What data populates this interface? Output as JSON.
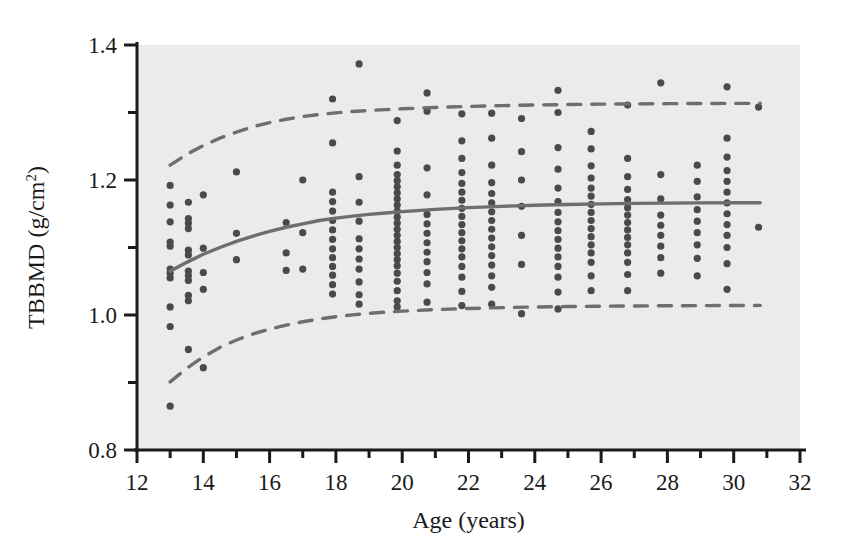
{
  "chart_data": {
    "type": "scatter",
    "title": "",
    "xlabel": "Age (years)",
    "ylabel": "TBBMD (g/cm2)",
    "ylabel_base": "TBBMD (g/cm",
    "ylabel_sup": "2",
    "ylabel_close": ")",
    "xlim": [
      12,
      32
    ],
    "ylim": [
      0.8,
      1.4
    ],
    "xticks_major": [
      12,
      14,
      16,
      18,
      20,
      22,
      24,
      26,
      28,
      30,
      32
    ],
    "xticks_minor": [
      13,
      15,
      17,
      19,
      21,
      23,
      25,
      27,
      29,
      31
    ],
    "yticks_major": [
      0.8,
      1.0,
      1.2,
      1.4
    ],
    "yticks_minor": [
      0.9,
      1.1,
      1.3
    ],
    "xtick_labels": [
      "12",
      "14",
      "16",
      "18",
      "20",
      "22",
      "24",
      "26",
      "28",
      "30",
      "32"
    ],
    "ytick_labels": [
      "0.8",
      "1.0",
      "1.2",
      "1.4"
    ],
    "grid": false,
    "legend": "none",
    "plot_bg": "#ebebeb",
    "point_color": "#4a4a4a",
    "line_color": "#6e6e6e",
    "axis_color": "#1a1a1a",
    "point_radius": 3.6,
    "series": [
      {
        "name": "Mean TBBMD curve",
        "style": "solid",
        "x": [
          13.0,
          13.5,
          14.0,
          14.5,
          15.0,
          15.5,
          16.0,
          16.5,
          17.0,
          17.5,
          18.0,
          18.5,
          19.0,
          19.5,
          20.0,
          21.0,
          22.0,
          23.0,
          24.0,
          25.0,
          26.0,
          27.0,
          28.0,
          29.0,
          30.0,
          30.8
        ],
        "values": [
          1.065,
          1.078,
          1.09,
          1.1,
          1.109,
          1.117,
          1.124,
          1.13,
          1.135,
          1.14,
          1.1435,
          1.1465,
          1.149,
          1.1512,
          1.1532,
          1.1565,
          1.159,
          1.161,
          1.1625,
          1.1637,
          1.1646,
          1.1653,
          1.1658,
          1.1661,
          1.1663,
          1.1664
        ]
      },
      {
        "name": "Upper reference limit",
        "style": "dashed",
        "x": [
          13.0,
          13.5,
          14.0,
          14.5,
          15.0,
          15.5,
          16.0,
          16.5,
          17.0,
          17.5,
          18.0,
          18.5,
          19.0,
          19.5,
          20.0,
          21.0,
          22.0,
          23.0,
          24.0,
          25.0,
          26.0,
          27.0,
          28.0,
          29.0,
          30.0,
          30.8
        ],
        "values": [
          1.222,
          1.238,
          1.251,
          1.262,
          1.271,
          1.279,
          1.285,
          1.29,
          1.294,
          1.297,
          1.2995,
          1.3015,
          1.303,
          1.3043,
          1.3055,
          1.3075,
          1.309,
          1.3102,
          1.3111,
          1.3118,
          1.3124,
          1.3128,
          1.3131,
          1.3133,
          1.3135,
          1.3136
        ]
      },
      {
        "name": "Lower reference limit",
        "style": "dashed",
        "x": [
          13.0,
          13.5,
          14.0,
          14.5,
          15.0,
          15.5,
          16.0,
          16.5,
          17.0,
          17.5,
          18.0,
          18.5,
          19.0,
          19.5,
          20.0,
          21.0,
          22.0,
          23.0,
          24.0,
          25.0,
          26.0,
          27.0,
          28.0,
          29.0,
          30.0,
          30.8
        ],
        "values": [
          0.901,
          0.921,
          0.938,
          0.952,
          0.963,
          0.972,
          0.979,
          0.985,
          0.99,
          0.994,
          0.9975,
          1.0002,
          1.0024,
          1.0042,
          1.0057,
          1.008,
          1.0097,
          1.0109,
          1.0118,
          1.0125,
          1.013,
          1.0134,
          1.0137,
          1.0139,
          1.0141,
          1.0142
        ]
      }
    ],
    "points": [
      {
        "x": 13.0,
        "y": 0.865
      },
      {
        "x": 13.0,
        "y": 0.983
      },
      {
        "x": 13.0,
        "y": 1.012
      },
      {
        "x": 13.0,
        "y": 1.055
      },
      {
        "x": 13.0,
        "y": 1.062
      },
      {
        "x": 13.0,
        "y": 1.068
      },
      {
        "x": 13.0,
        "y": 1.102
      },
      {
        "x": 13.0,
        "y": 1.108
      },
      {
        "x": 13.0,
        "y": 1.138
      },
      {
        "x": 13.0,
        "y": 1.163
      },
      {
        "x": 13.0,
        "y": 1.192
      },
      {
        "x": 13.55,
        "y": 0.949
      },
      {
        "x": 13.55,
        "y": 1.021
      },
      {
        "x": 13.55,
        "y": 1.029
      },
      {
        "x": 13.55,
        "y": 1.051
      },
      {
        "x": 13.55,
        "y": 1.058
      },
      {
        "x": 13.55,
        "y": 1.065
      },
      {
        "x": 13.55,
        "y": 1.089
      },
      {
        "x": 13.55,
        "y": 1.096
      },
      {
        "x": 13.55,
        "y": 1.128
      },
      {
        "x": 13.55,
        "y": 1.136
      },
      {
        "x": 13.55,
        "y": 1.143
      },
      {
        "x": 13.55,
        "y": 1.167
      },
      {
        "x": 14.0,
        "y": 0.922
      },
      {
        "x": 14.0,
        "y": 1.038
      },
      {
        "x": 14.0,
        "y": 1.063
      },
      {
        "x": 14.0,
        "y": 1.099
      },
      {
        "x": 14.0,
        "y": 1.178
      },
      {
        "x": 15.0,
        "y": 1.082
      },
      {
        "x": 15.0,
        "y": 1.121
      },
      {
        "x": 15.0,
        "y": 1.212
      },
      {
        "x": 16.5,
        "y": 1.066
      },
      {
        "x": 16.5,
        "y": 1.092
      },
      {
        "x": 16.5,
        "y": 1.137
      },
      {
        "x": 17.0,
        "y": 1.068
      },
      {
        "x": 17.0,
        "y": 1.122
      },
      {
        "x": 17.0,
        "y": 1.2
      },
      {
        "x": 17.9,
        "y": 1.031
      },
      {
        "x": 17.9,
        "y": 1.045
      },
      {
        "x": 17.9,
        "y": 1.059
      },
      {
        "x": 17.9,
        "y": 1.072
      },
      {
        "x": 17.9,
        "y": 1.085
      },
      {
        "x": 17.9,
        "y": 1.098
      },
      {
        "x": 17.9,
        "y": 1.112
      },
      {
        "x": 17.9,
        "y": 1.126
      },
      {
        "x": 17.9,
        "y": 1.14
      },
      {
        "x": 17.9,
        "y": 1.154
      },
      {
        "x": 17.9,
        "y": 1.168
      },
      {
        "x": 17.9,
        "y": 1.182
      },
      {
        "x": 17.9,
        "y": 1.255
      },
      {
        "x": 17.9,
        "y": 1.32
      },
      {
        "x": 18.7,
        "y": 1.016
      },
      {
        "x": 18.7,
        "y": 1.03
      },
      {
        "x": 18.7,
        "y": 1.049
      },
      {
        "x": 18.7,
        "y": 1.068
      },
      {
        "x": 18.7,
        "y": 1.083
      },
      {
        "x": 18.7,
        "y": 1.098
      },
      {
        "x": 18.7,
        "y": 1.113
      },
      {
        "x": 18.7,
        "y": 1.139
      },
      {
        "x": 18.7,
        "y": 1.167
      },
      {
        "x": 18.7,
        "y": 1.205
      },
      {
        "x": 18.7,
        "y": 1.372
      },
      {
        "x": 19.85,
        "y": 1.012
      },
      {
        "x": 19.85,
        "y": 1.021
      },
      {
        "x": 19.85,
        "y": 1.036
      },
      {
        "x": 19.85,
        "y": 1.05
      },
      {
        "x": 19.85,
        "y": 1.062
      },
      {
        "x": 19.85,
        "y": 1.073
      },
      {
        "x": 19.85,
        "y": 1.082
      },
      {
        "x": 19.85,
        "y": 1.091
      },
      {
        "x": 19.85,
        "y": 1.1
      },
      {
        "x": 19.85,
        "y": 1.109
      },
      {
        "x": 19.85,
        "y": 1.118
      },
      {
        "x": 19.85,
        "y": 1.127
      },
      {
        "x": 19.85,
        "y": 1.136
      },
      {
        "x": 19.85,
        "y": 1.145
      },
      {
        "x": 19.85,
        "y": 1.154
      },
      {
        "x": 19.85,
        "y": 1.163
      },
      {
        "x": 19.85,
        "y": 1.172
      },
      {
        "x": 19.85,
        "y": 1.181
      },
      {
        "x": 19.85,
        "y": 1.19
      },
      {
        "x": 19.85,
        "y": 1.199
      },
      {
        "x": 19.85,
        "y": 1.208
      },
      {
        "x": 19.85,
        "y": 1.222
      },
      {
        "x": 19.85,
        "y": 1.243
      },
      {
        "x": 19.85,
        "y": 1.288
      },
      {
        "x": 20.75,
        "y": 1.019
      },
      {
        "x": 20.75,
        "y": 1.046
      },
      {
        "x": 20.75,
        "y": 1.063
      },
      {
        "x": 20.75,
        "y": 1.079
      },
      {
        "x": 20.75,
        "y": 1.093
      },
      {
        "x": 20.75,
        "y": 1.107
      },
      {
        "x": 20.75,
        "y": 1.121
      },
      {
        "x": 20.75,
        "y": 1.135
      },
      {
        "x": 20.75,
        "y": 1.149
      },
      {
        "x": 20.75,
        "y": 1.178
      },
      {
        "x": 20.75,
        "y": 1.218
      },
      {
        "x": 20.75,
        "y": 1.302
      },
      {
        "x": 20.75,
        "y": 1.329
      },
      {
        "x": 21.8,
        "y": 1.014
      },
      {
        "x": 21.8,
        "y": 1.035
      },
      {
        "x": 21.8,
        "y": 1.056
      },
      {
        "x": 21.8,
        "y": 1.072
      },
      {
        "x": 21.8,
        "y": 1.086
      },
      {
        "x": 21.8,
        "y": 1.098
      },
      {
        "x": 21.8,
        "y": 1.11
      },
      {
        "x": 21.8,
        "y": 1.122
      },
      {
        "x": 21.8,
        "y": 1.134
      },
      {
        "x": 21.8,
        "y": 1.146
      },
      {
        "x": 21.8,
        "y": 1.158
      },
      {
        "x": 21.8,
        "y": 1.17
      },
      {
        "x": 21.8,
        "y": 1.182
      },
      {
        "x": 21.8,
        "y": 1.195
      },
      {
        "x": 21.8,
        "y": 1.211
      },
      {
        "x": 21.8,
        "y": 1.232
      },
      {
        "x": 21.8,
        "y": 1.258
      },
      {
        "x": 21.8,
        "y": 1.298
      },
      {
        "x": 22.7,
        "y": 1.016
      },
      {
        "x": 22.7,
        "y": 1.041
      },
      {
        "x": 22.7,
        "y": 1.058
      },
      {
        "x": 22.7,
        "y": 1.074
      },
      {
        "x": 22.7,
        "y": 1.088
      },
      {
        "x": 22.7,
        "y": 1.101
      },
      {
        "x": 22.7,
        "y": 1.114
      },
      {
        "x": 22.7,
        "y": 1.127
      },
      {
        "x": 22.7,
        "y": 1.14
      },
      {
        "x": 22.7,
        "y": 1.153
      },
      {
        "x": 22.7,
        "y": 1.166
      },
      {
        "x": 22.7,
        "y": 1.18
      },
      {
        "x": 22.7,
        "y": 1.196
      },
      {
        "x": 22.7,
        "y": 1.222
      },
      {
        "x": 22.7,
        "y": 1.262
      },
      {
        "x": 22.7,
        "y": 1.299
      },
      {
        "x": 23.6,
        "y": 1.002
      },
      {
        "x": 23.6,
        "y": 1.075
      },
      {
        "x": 23.6,
        "y": 1.118
      },
      {
        "x": 23.6,
        "y": 1.161
      },
      {
        "x": 23.6,
        "y": 1.2
      },
      {
        "x": 23.6,
        "y": 1.242
      },
      {
        "x": 23.6,
        "y": 1.291
      },
      {
        "x": 24.7,
        "y": 1.009
      },
      {
        "x": 24.7,
        "y": 1.034
      },
      {
        "x": 24.7,
        "y": 1.056
      },
      {
        "x": 24.7,
        "y": 1.072
      },
      {
        "x": 24.7,
        "y": 1.086
      },
      {
        "x": 24.7,
        "y": 1.099
      },
      {
        "x": 24.7,
        "y": 1.112
      },
      {
        "x": 24.7,
        "y": 1.125
      },
      {
        "x": 24.7,
        "y": 1.138
      },
      {
        "x": 24.7,
        "y": 1.152
      },
      {
        "x": 24.7,
        "y": 1.168
      },
      {
        "x": 24.7,
        "y": 1.188
      },
      {
        "x": 24.7,
        "y": 1.216
      },
      {
        "x": 24.7,
        "y": 1.248
      },
      {
        "x": 24.7,
        "y": 1.3
      },
      {
        "x": 24.7,
        "y": 1.333
      },
      {
        "x": 25.7,
        "y": 1.036
      },
      {
        "x": 25.7,
        "y": 1.058
      },
      {
        "x": 25.7,
        "y": 1.078
      },
      {
        "x": 25.7,
        "y": 1.092
      },
      {
        "x": 25.7,
        "y": 1.104
      },
      {
        "x": 25.7,
        "y": 1.116
      },
      {
        "x": 25.7,
        "y": 1.128
      },
      {
        "x": 25.7,
        "y": 1.14
      },
      {
        "x": 25.7,
        "y": 1.152
      },
      {
        "x": 25.7,
        "y": 1.164
      },
      {
        "x": 25.7,
        "y": 1.176
      },
      {
        "x": 25.7,
        "y": 1.188
      },
      {
        "x": 25.7,
        "y": 1.203
      },
      {
        "x": 25.7,
        "y": 1.221
      },
      {
        "x": 25.7,
        "y": 1.246
      },
      {
        "x": 25.7,
        "y": 1.272
      },
      {
        "x": 26.8,
        "y": 1.036
      },
      {
        "x": 26.8,
        "y": 1.06
      },
      {
        "x": 26.8,
        "y": 1.078
      },
      {
        "x": 26.8,
        "y": 1.092
      },
      {
        "x": 26.8,
        "y": 1.104
      },
      {
        "x": 26.8,
        "y": 1.115
      },
      {
        "x": 26.8,
        "y": 1.126
      },
      {
        "x": 26.8,
        "y": 1.137
      },
      {
        "x": 26.8,
        "y": 1.148
      },
      {
        "x": 26.8,
        "y": 1.159
      },
      {
        "x": 26.8,
        "y": 1.171
      },
      {
        "x": 26.8,
        "y": 1.186
      },
      {
        "x": 26.8,
        "y": 1.205
      },
      {
        "x": 26.8,
        "y": 1.232
      },
      {
        "x": 26.8,
        "y": 1.311
      },
      {
        "x": 27.8,
        "y": 1.062
      },
      {
        "x": 27.8,
        "y": 1.085
      },
      {
        "x": 27.8,
        "y": 1.102
      },
      {
        "x": 27.8,
        "y": 1.118
      },
      {
        "x": 27.8,
        "y": 1.133
      },
      {
        "x": 27.8,
        "y": 1.148
      },
      {
        "x": 27.8,
        "y": 1.172
      },
      {
        "x": 27.8,
        "y": 1.208
      },
      {
        "x": 27.8,
        "y": 1.344
      },
      {
        "x": 28.9,
        "y": 1.058
      },
      {
        "x": 28.9,
        "y": 1.084
      },
      {
        "x": 28.9,
        "y": 1.104
      },
      {
        "x": 28.9,
        "y": 1.122
      },
      {
        "x": 28.9,
        "y": 1.139
      },
      {
        "x": 28.9,
        "y": 1.156
      },
      {
        "x": 28.9,
        "y": 1.175
      },
      {
        "x": 28.9,
        "y": 1.198
      },
      {
        "x": 28.9,
        "y": 1.222
      },
      {
        "x": 29.8,
        "y": 1.038
      },
      {
        "x": 29.8,
        "y": 1.076
      },
      {
        "x": 29.8,
        "y": 1.1
      },
      {
        "x": 29.8,
        "y": 1.118
      },
      {
        "x": 29.8,
        "y": 1.134
      },
      {
        "x": 29.8,
        "y": 1.15
      },
      {
        "x": 29.8,
        "y": 1.166
      },
      {
        "x": 29.8,
        "y": 1.182
      },
      {
        "x": 29.8,
        "y": 1.198
      },
      {
        "x": 29.8,
        "y": 1.214
      },
      {
        "x": 29.8,
        "y": 1.234
      },
      {
        "x": 29.8,
        "y": 1.262
      },
      {
        "x": 29.8,
        "y": 1.338
      },
      {
        "x": 30.75,
        "y": 1.13
      },
      {
        "x": 30.75,
        "y": 1.308
      }
    ]
  }
}
